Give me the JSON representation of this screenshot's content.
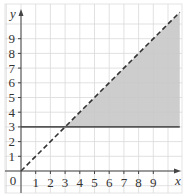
{
  "chart_data": {
    "type": "line",
    "title": "",
    "xlabel": "x",
    "ylabel": "y",
    "origin_label": "0",
    "xlim": [
      0,
      10.8
    ],
    "ylim": [
      0,
      10.8
    ],
    "x_ticks": [
      "1",
      "2",
      "3",
      "4",
      "5",
      "6",
      "7",
      "8",
      "9"
    ],
    "y_ticks": [
      "1",
      "2",
      "3",
      "4",
      "5",
      "6",
      "7",
      "8",
      "9"
    ],
    "grid": true,
    "series": [
      {
        "name": "y = x",
        "style": "dashed",
        "color": "#333333",
        "x": [
          0,
          10.8
        ],
        "y": [
          0,
          10.8
        ]
      },
      {
        "name": "y = 3",
        "style": "solid",
        "color": "#555555",
        "x": [
          0,
          10.8
        ],
        "y": [
          3,
          3
        ]
      }
    ],
    "shaded_region": {
      "description": "region where y >= 3 and y < x",
      "color": "#c8c8c8",
      "vertices": [
        [
          3,
          3
        ],
        [
          10.8,
          3
        ],
        [
          10.8,
          10.8
        ]
      ]
    }
  },
  "colors": {
    "grid": "#d9d9d9",
    "axis": "#444444",
    "shade": "#c8c8c8",
    "border": "#e4e4e4"
  }
}
